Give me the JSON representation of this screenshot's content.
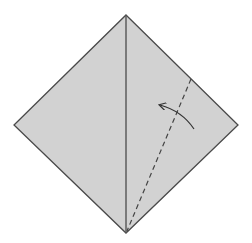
{
  "diagram": {
    "type": "origami-fold-step",
    "colors": {
      "paper_fill": "#d2d2d2",
      "outline": "#4a4a4a",
      "center_crease": "#555555",
      "fold_line": "#444444",
      "arrow": "#333333",
      "background": "#ffffff"
    },
    "square": {
      "top": [
        126,
        15
      ],
      "right": [
        238,
        125
      ],
      "bottom": [
        126,
        233
      ],
      "left": [
        14,
        125
      ]
    },
    "center_crease": {
      "from": [
        126,
        15
      ],
      "to": [
        126,
        233
      ],
      "style": "solid"
    },
    "valley_fold": {
      "from": [
        191,
        79
      ],
      "to": [
        127,
        231
      ],
      "style": "dashed"
    },
    "fold_arrow": {
      "from": [
        194,
        129
      ],
      "to": [
        160,
        105
      ],
      "direction": "fold edge toward center crease"
    }
  }
}
